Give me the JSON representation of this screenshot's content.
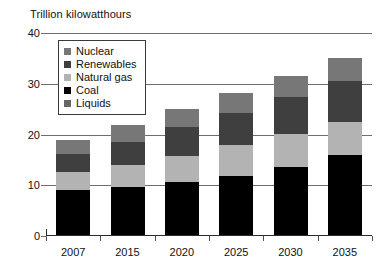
{
  "chart_data": {
    "type": "bar",
    "title": "Trillion kilowatthours",
    "subtitle": "",
    "xlabel": "",
    "ylabel": "Trillion kilowatthours",
    "stacked": true,
    "grid": true,
    "legend_position": "upper-left-inside",
    "ylim": [
      0,
      40
    ],
    "yticks": [
      "0",
      "10",
      "20",
      "30",
      "40"
    ],
    "categories": [
      "2007",
      "2015",
      "2020",
      "2025",
      "2030",
      "2035"
    ],
    "series": [
      {
        "name": "Liquids",
        "color": "#666666",
        "values": [
          0.2,
          0.2,
          0.2,
          0.2,
          0.2,
          0.2
        ]
      },
      {
        "name": "Coal",
        "color": "#000000",
        "values": [
          8.8,
          9.5,
          10.4,
          11.6,
          13.4,
          15.7
        ]
      },
      {
        "name": "Natural gas",
        "color": "#b3b3b3",
        "values": [
          3.7,
          4.3,
          5.1,
          6.2,
          6.6,
          6.6
        ]
      },
      {
        "name": "Renewables",
        "color": "#3f3f3f",
        "values": [
          3.5,
          4.6,
          5.8,
          6.2,
          7.1,
          8.0
        ]
      },
      {
        "name": "Nuclear",
        "color": "#777777",
        "values": [
          2.7,
          3.3,
          3.6,
          4.0,
          4.2,
          4.6
        ]
      }
    ],
    "totals": [
      18.9,
      21.9,
      25.1,
      28.2,
      31.5,
      35.1
    ]
  },
  "legend": {
    "items": [
      {
        "label": "Nuclear",
        "color": "#777777"
      },
      {
        "label": "Renewables",
        "color": "#3f3f3f"
      },
      {
        "label": "Natural gas",
        "color": "#b3b3b3"
      },
      {
        "label": "Coal",
        "color": "#000000"
      },
      {
        "label": "Liquids",
        "color": "#666666"
      }
    ]
  },
  "colors": {
    "axis": "#2b2b2b",
    "grid": "#6f6f6f",
    "text": "#111111",
    "background": "#ffffff"
  }
}
